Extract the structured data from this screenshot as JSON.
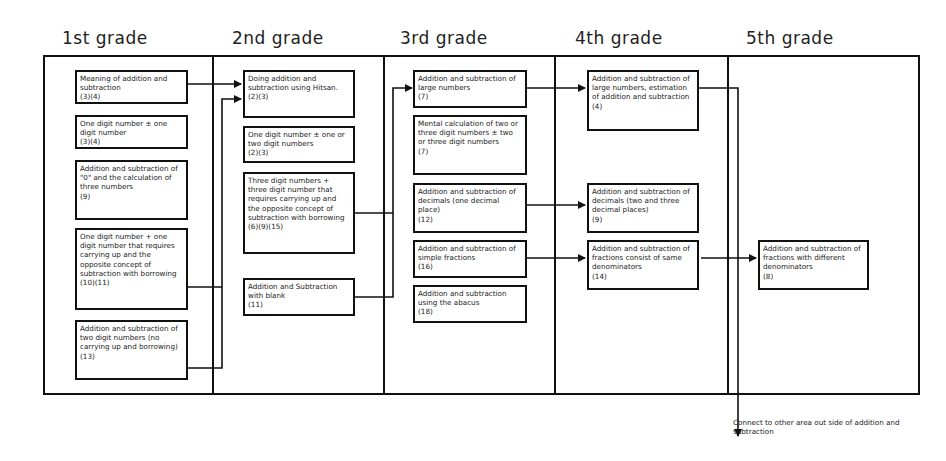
{
  "headers": [
    "1st grade",
    "2nd grade",
    "3rd grade",
    "4th grade",
    "5th grade"
  ],
  "grade1": [
    {
      "text": "Meaning of addition and subtraction",
      "code": "(3)(4)"
    },
    {
      "text": "One digit number ± one digit number",
      "code": "(3)(4)"
    },
    {
      "text": "Addition and subtraction of \"0\" and the calculation of three numbers",
      "code": "(9)"
    },
    {
      "text": "One digit number + one digit number that requires carrying up and the opposite concept of subtraction with borrowing",
      "code": "(10)(11)"
    },
    {
      "text": "Addition and subtraction of two digit numbers (no carrying up and borrowing)",
      "code": "(13)"
    }
  ],
  "grade2": [
    {
      "text": "Doing addition and subtraction using Hitsan.",
      "code": "(2)(3)"
    },
    {
      "text": "One digit number ± one or two digit numbers",
      "code": "(2)(3)"
    },
    {
      "text": "Three digit numbers + three digit number that requires carrying up and the opposite concept of subtraction with borrowing",
      "code": "(6)(9)(15)"
    },
    {
      "text": "Addition and Subtraction with blank",
      "code": "(11)"
    }
  ],
  "grade3": [
    {
      "text": "Addition and subtraction of large numbers",
      "code": "(7)"
    },
    {
      "text": "Mental calculation of two or three digit numbers ± two or three digit numbers",
      "code": "(7)"
    },
    {
      "text": "Addition and subtraction of decimals (one decimal place)",
      "code": "(12)"
    },
    {
      "text": "Addition and subtraction of simple fractions",
      "code": "(16)"
    },
    {
      "text": "Addition and subtraction using the abacus",
      "code": "(18)"
    }
  ],
  "grade4": [
    {
      "text": "Addition and subtraction of large numbers, estimation of addition and subtraction",
      "code": "(4)"
    },
    {
      "text": "Addition and subtraction of decimals (two and three decimal places)",
      "code": "(9)"
    },
    {
      "text": "Addition and subtraction of fractions consist of same denominators",
      "code": "(14)"
    }
  ],
  "grade5": [
    {
      "text": "Addition and subtraction of fractions with different denominators",
      "code": "(8)"
    }
  ],
  "footnote": "Connect to other area out side of addition and subtraction"
}
